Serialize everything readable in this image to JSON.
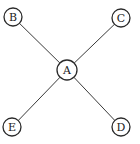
{
  "diagram": {
    "type": "star-graph",
    "center_node": "A",
    "nodes": [
      {
        "id": "A",
        "label": "A",
        "cx": 67,
        "cy": 70,
        "r": 10
      },
      {
        "id": "B",
        "label": "B",
        "cx": 13,
        "cy": 17,
        "r": 9
      },
      {
        "id": "C",
        "label": "C",
        "cx": 121,
        "cy": 18,
        "r": 9
      },
      {
        "id": "D",
        "label": "D",
        "cx": 121,
        "cy": 127,
        "r": 9
      },
      {
        "id": "E",
        "label": "E",
        "cx": 12,
        "cy": 127,
        "r": 9
      }
    ],
    "edges": [
      {
        "from": "A",
        "to": "B"
      },
      {
        "from": "A",
        "to": "C"
      },
      {
        "from": "A",
        "to": "D"
      },
      {
        "from": "A",
        "to": "E"
      }
    ],
    "colors": {
      "stroke": "#2a2a2a",
      "edge": "#3a3a3a",
      "fill": "#ffffff",
      "text": "#222222"
    }
  }
}
